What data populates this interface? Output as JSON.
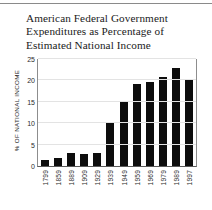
{
  "chart_data": {
    "type": "bar",
    "title": "American Federal Government Expenditures as Percentage of Estimated National Income",
    "title_lines": [
      "American Federal Government",
      "Expenditures as Percentage of",
      "Estimated National Income"
    ],
    "xlabel": "",
    "ylabel": "% OF NATIONAL INCOME",
    "ylim": [
      0,
      25
    ],
    "yticks": [
      0,
      5,
      10,
      15,
      20,
      25
    ],
    "ytick_labels": [
      "0",
      "5",
      "10",
      "15",
      "20",
      "25"
    ],
    "grid": true,
    "legend": false,
    "bar_color": "#0d0d0d",
    "categories": [
      "1799",
      "1859",
      "1889",
      "1909",
      "1929",
      "1939",
      "1949",
      "1959",
      "1969",
      "1979",
      "1989",
      "1997"
    ],
    "values": [
      1.4,
      1.8,
      3.0,
      2.8,
      3.1,
      10.0,
      15.3,
      19.1,
      19.6,
      20.9,
      22.9,
      20.2
    ]
  }
}
